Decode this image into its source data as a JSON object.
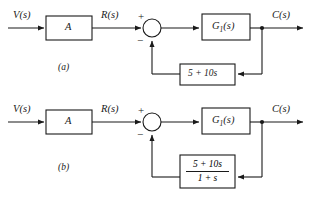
{
  "figure": {
    "type": "control-system-block-diagram",
    "background_color": "#ffffff",
    "line_color": "#1a1a1a",
    "diagram_count": 2
  },
  "diagrams": [
    {
      "caption": "(a)",
      "input_label": "V(s)",
      "gain_block_label": "A",
      "error_label": "R(s)",
      "sum_plus": "+",
      "sum_minus": "−",
      "forward_block_label_main": "G",
      "forward_block_label_sub": "1",
      "forward_block_label_tail": "(s)",
      "forward_block_label": "G1(s)",
      "feedback_block_label": "5 + 10s",
      "feedback_is_fraction": false,
      "output_label": "C(s)"
    },
    {
      "caption": "(b)",
      "input_label": "V(s)",
      "gain_block_label": "A",
      "error_label": "R(s)",
      "sum_plus": "+",
      "sum_minus": "−",
      "forward_block_label_main": "G",
      "forward_block_label_sub": "1",
      "forward_block_label_tail": "(s)",
      "forward_block_label": "G1(s)",
      "feedback_block_numerator": "5 + 10s",
      "feedback_block_denominator": "1 + s",
      "feedback_is_fraction": true,
      "output_label": "C(s)"
    }
  ]
}
